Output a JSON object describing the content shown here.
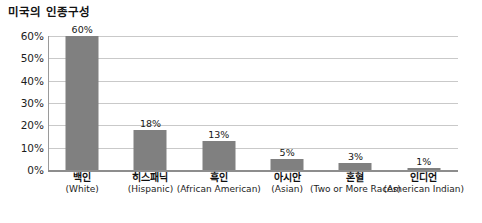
{
  "chart_data": {
    "type": "bar",
    "title": "미국의 인종구성",
    "xlabel": "",
    "ylabel": "",
    "ylim": [
      0,
      60
    ],
    "grid": true,
    "legend": false,
    "orientation": "vertical",
    "bar_color": "#808080",
    "categories": [
      "백인 (White)",
      "히스패닉 (Hispanic)",
      "흑인 (African American)",
      "아시안 (Asian)",
      "혼혈 (Two or More Races)",
      "인디언 (American Indian)"
    ],
    "values": [
      60,
      18,
      13,
      5,
      3,
      1
    ],
    "value_labels": [
      "60%",
      "18%",
      "13%",
      "5%",
      "3%",
      "1%"
    ],
    "ytick_labels": [
      "60%",
      "50%",
      "40%",
      "30%",
      "20%",
      "10%",
      "0%"
    ],
    "ytick_values": [
      60,
      50,
      40,
      30,
      20,
      10,
      0
    ]
  },
  "title": "미국의 인종구성",
  "y_axis": {
    "ticks": [
      {
        "label": "60%",
        "value": 60
      },
      {
        "label": "50%",
        "value": 50
      },
      {
        "label": "40%",
        "value": 40
      },
      {
        "label": "30%",
        "value": 30
      },
      {
        "label": "20%",
        "value": 20
      },
      {
        "label": "10%",
        "value": 10
      },
      {
        "label": "0%",
        "value": 0
      }
    ]
  },
  "bars": [
    {
      "ko": "백인",
      "en": "(White)",
      "value": 60,
      "value_label": "60%"
    },
    {
      "ko": "히스패닉",
      "en": "(Hispanic)",
      "value": 18,
      "value_label": "18%"
    },
    {
      "ko": "흑인",
      "en": "(African American)",
      "value": 13,
      "value_label": "13%"
    },
    {
      "ko": "아시안",
      "en": "(Asian)",
      "value": 5,
      "value_label": "5%"
    },
    {
      "ko": "혼혈",
      "en": "(Two or More Races)",
      "value": 3,
      "value_label": "3%"
    },
    {
      "ko": "인디언",
      "en": "(American Indian)",
      "value": 1,
      "value_label": "1%"
    }
  ],
  "colors": {
    "bar_fill": "#808080",
    "gridline": "#c9c9c9",
    "axis": "#8d8d8d",
    "background": "#ffffff",
    "text": "#141414"
  }
}
